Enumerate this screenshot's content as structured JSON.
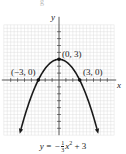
{
  "chart_data": {
    "type": "line",
    "title": "",
    "function": "y = -(1/3)x^2 + 3",
    "xlabel": "x",
    "ylabel": "y",
    "xlim": [
      -8,
      8
    ],
    "ylim": [
      -8,
      8
    ],
    "grid": true,
    "legend": "none",
    "series": [
      {
        "name": "y = -1/3 x^2 + 3",
        "x": [
          -5.6,
          -5,
          -4,
          -3,
          -2,
          -1,
          0,
          1,
          2,
          3,
          4,
          5,
          5.6
        ],
        "y": [
          -7.45,
          -5.33,
          -2.33,
          0,
          1.67,
          2.67,
          3,
          2.67,
          1.67,
          0,
          -2.33,
          -5.33,
          -7.45
        ]
      }
    ],
    "points": [
      {
        "label": "(0, 3)",
        "x": 0,
        "y": 3
      },
      {
        "label": "(-3, 0)",
        "x": -3,
        "y": 0
      },
      {
        "label": "(3, 0)",
        "x": 3,
        "y": 0
      }
    ],
    "annotations": [
      "(0, 3)",
      "(−3, 0)",
      "(3, 0)",
      "y = −⅓x² + 3"
    ]
  },
  "labels": {
    "x_axis": "x",
    "y_axis": "y",
    "vertex": "(0, 3)",
    "left_intercept": "(−3, 0)",
    "right_intercept": "(3, 0)",
    "top_cut_text": "g"
  },
  "equation": {
    "lhs": "y = −",
    "frac_num": "1",
    "frac_den": "3",
    "var": "x",
    "exp": "2",
    "rest": " + 3"
  },
  "colors": {
    "grid": "#d9d9d9",
    "axis": "#333333",
    "curve": "#1a1a1a",
    "point": "#111111"
  }
}
